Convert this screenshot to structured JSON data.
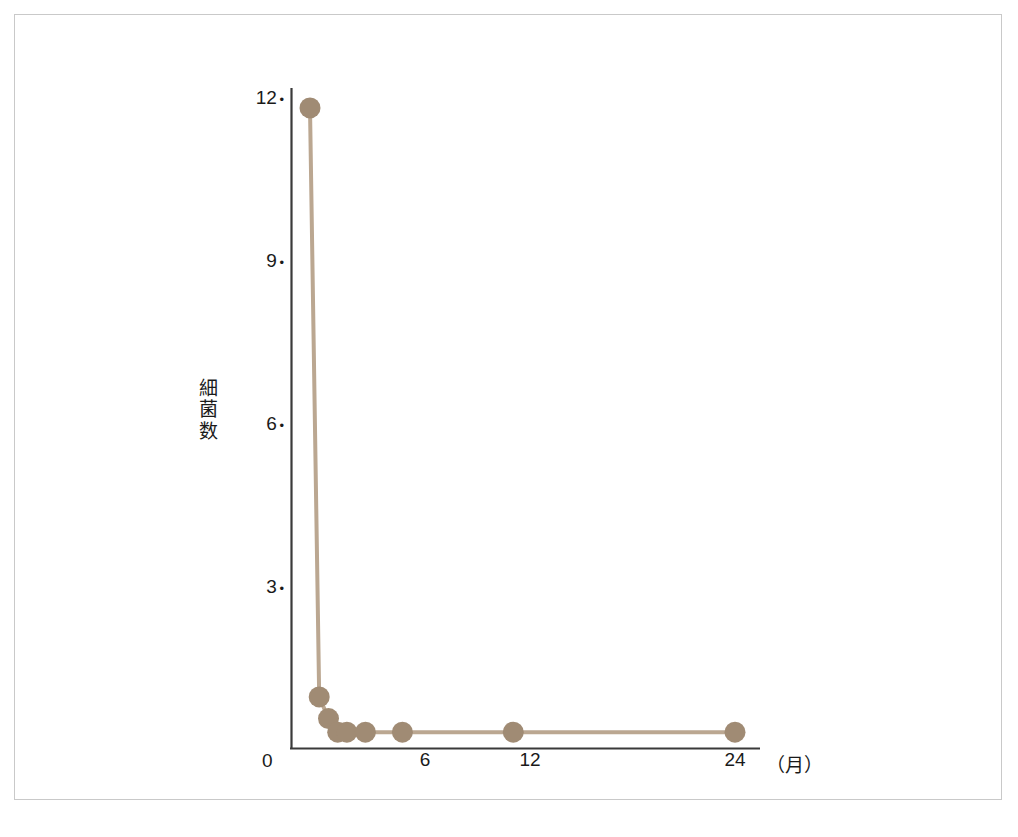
{
  "figure": {
    "background_color": "#ffffff",
    "frame_color": "#c9c9c9"
  },
  "chart_data": {
    "type": "line",
    "title": "",
    "subtitle": "",
    "xlabel": "（月）",
    "ylabel": "細菌数",
    "ylabel_chars": [
      "細",
      "菌",
      "数"
    ],
    "x": [
      1,
      1.5,
      2,
      2.5,
      3,
      4,
      6,
      12,
      24
    ],
    "values": [
      11.8,
      0.95,
      0.55,
      0.3,
      0.3,
      0.3,
      0.3,
      0.3,
      0.3
    ],
    "x_tick_labels": [
      "0",
      "6",
      "12",
      "24"
    ],
    "x_tick_values": [
      0,
      6,
      12,
      24
    ],
    "y_tick_labels": [
      "12",
      "9",
      "6",
      "3"
    ],
    "y_tick_values": [
      12,
      9,
      6,
      3
    ],
    "xlim": [
      0,
      25.2
    ],
    "ylim": [
      0,
      12.6
    ],
    "grid": false,
    "legend": null,
    "marker": "circle",
    "marker_color": "#a08b74",
    "line_color": "#bba791",
    "axis_color": "#3a3a3a",
    "origin_label": "0"
  }
}
